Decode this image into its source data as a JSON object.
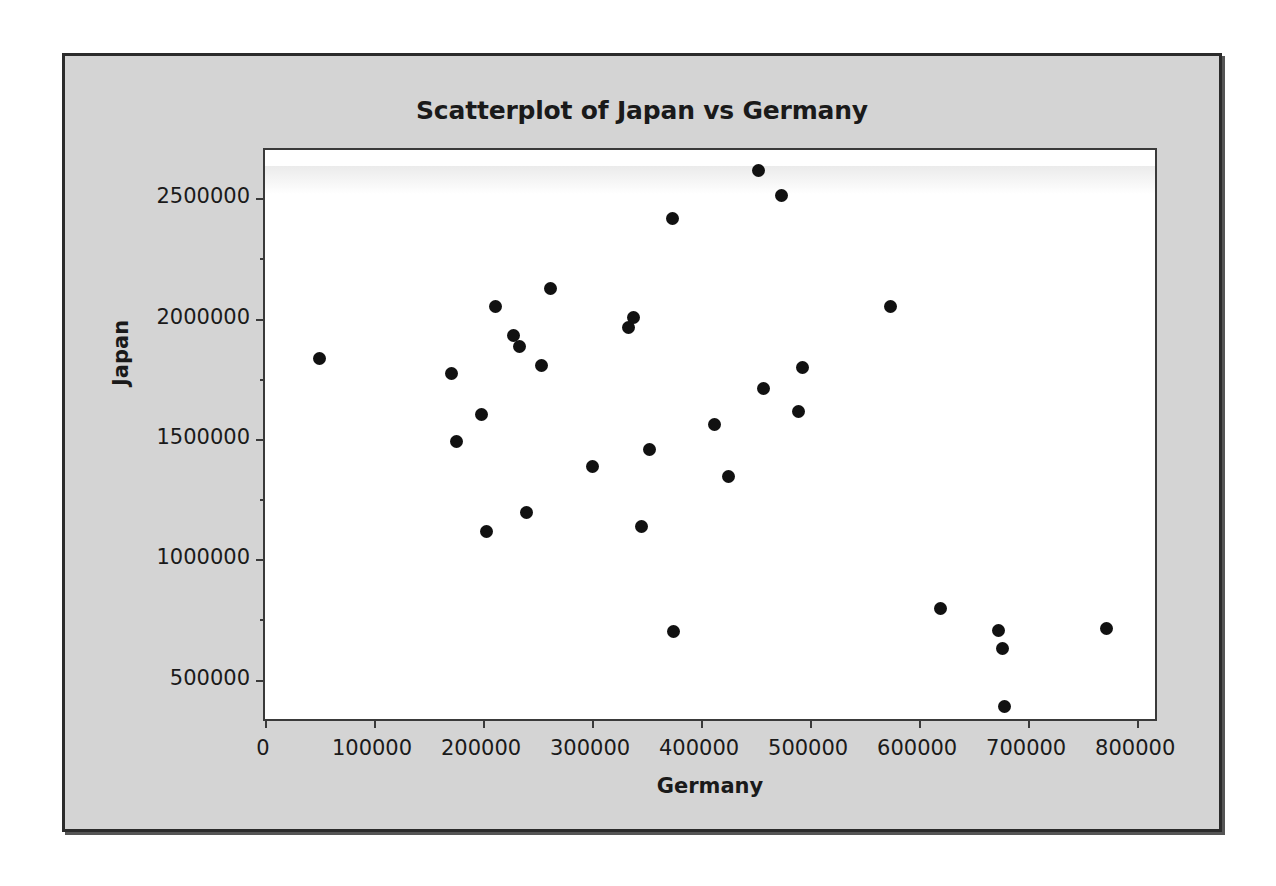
{
  "chart": {
    "title": "Scatterplot of Japan vs Germany",
    "x_axis_title": "Germany",
    "y_axis_title": "Japan",
    "panel_background": "#ffffff",
    "frame_background": "#d4d4d4",
    "marker_color": "#111111"
  },
  "chart_data": {
    "type": "scatter",
    "title": "Scatterplot of Japan vs Germany",
    "xlabel": "Germany",
    "ylabel": "Japan",
    "xlim": [
      0,
      820000
    ],
    "ylim": [
      320000,
      2700000
    ],
    "xticks": [
      0,
      100000,
      200000,
      300000,
      400000,
      500000,
      600000,
      700000,
      800000
    ],
    "xticklabels": [
      "0",
      "100000",
      "200000",
      "300000",
      "400000",
      "500000",
      "600000",
      "700000",
      "800000"
    ],
    "yticks": [
      500000,
      1000000,
      1500000,
      2000000,
      2500000
    ],
    "yticklabels": [
      "500000",
      "1000000",
      "1500000",
      "2000000",
      "2500000"
    ],
    "grid": false,
    "legend": false,
    "marker": "filled-circle",
    "series": [
      {
        "name": "Japan vs Germany",
        "points": [
          [
            50000,
            1835000
          ],
          [
            171000,
            1770000
          ],
          [
            176000,
            1491000
          ],
          [
            199000,
            1600000
          ],
          [
            203000,
            1117000
          ],
          [
            211000,
            2052000
          ],
          [
            228000,
            1930000
          ],
          [
            233000,
            1883000
          ],
          [
            240000,
            1196000
          ],
          [
            254000,
            1804000
          ],
          [
            262000,
            2126000
          ],
          [
            300000,
            1387000
          ],
          [
            333000,
            1961000
          ],
          [
            338000,
            2004000
          ],
          [
            345000,
            1135000
          ],
          [
            353000,
            1457000
          ],
          [
            374000,
            2417000
          ],
          [
            375000,
            700000
          ],
          [
            412000,
            1561000
          ],
          [
            425000,
            1343000
          ],
          [
            453000,
            2613000
          ],
          [
            457000,
            1709000
          ],
          [
            474000,
            2513000
          ],
          [
            489000,
            1613000
          ],
          [
            493000,
            1796000
          ],
          [
            574000,
            2052000
          ],
          [
            620000,
            796000
          ],
          [
            673000,
            704000
          ],
          [
            676000,
            630000
          ],
          [
            678000,
            387000
          ],
          [
            772000,
            713000
          ]
        ]
      }
    ],
    "n_points": 31
  }
}
